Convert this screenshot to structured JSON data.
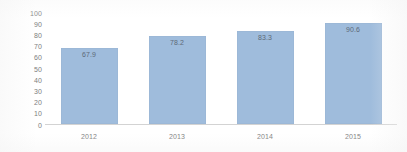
{
  "chart_data": {
    "type": "bar",
    "title": "",
    "subtitle": "",
    "xlabel": "",
    "ylabel": "",
    "categories": [
      "2012",
      "2013",
      "2014",
      "2015"
    ],
    "values": [
      67.9,
      78.2,
      83.3,
      90.6
    ],
    "data_labels": [
      "67.9",
      "78.2",
      "83.3",
      "90.6"
    ],
    "ylim": [
      0,
      100
    ],
    "y_tick_step": 10,
    "y_ticks": [
      "100",
      "90",
      "80",
      "70",
      "60",
      "50",
      "40",
      "30",
      "20",
      "10",
      "0"
    ],
    "grid": false,
    "legend": false,
    "legend_position": "none",
    "bar_color": "#9fbcdc",
    "axis_color": "#d3d3d3",
    "label_color": "#7d7d7d",
    "data_label_color": "#5e6a78",
    "background_color": "#ffffff",
    "data_label_position": "inside-top"
  }
}
